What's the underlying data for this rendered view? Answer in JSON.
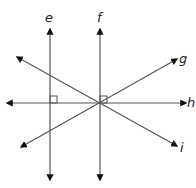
{
  "diagram": {
    "type": "geometry-lines",
    "stroke_color": "#555555",
    "arrow_color": "#111111",
    "lines": [
      {
        "id": "e",
        "label": "e",
        "kind": "vertical",
        "x1": 50,
        "y1": 29,
        "x2": 50,
        "y2": 180,
        "label_x": 45,
        "label_y": 11
      },
      {
        "id": "f",
        "label": "f",
        "kind": "vertical",
        "x1": 100,
        "y1": 29,
        "x2": 100,
        "y2": 180,
        "label_x": 97,
        "label_y": 11
      },
      {
        "id": "g",
        "label": "g",
        "kind": "diagonal",
        "x1": 21,
        "y1": 147,
        "x2": 177,
        "y2": 59,
        "label_x": 179,
        "label_y": 52
      },
      {
        "id": "h",
        "label": "h",
        "kind": "horizontal",
        "x1": 7,
        "y1": 103,
        "x2": 186,
        "y2": 103,
        "label_x": 187,
        "label_y": 96
      },
      {
        "id": "i",
        "label": "i",
        "kind": "diagonal",
        "x1": 17,
        "y1": 57,
        "x2": 177,
        "y2": 146,
        "label_x": 180,
        "label_y": 141
      }
    ],
    "right_angles": [
      {
        "at": "e-h",
        "x": 50,
        "y": 96,
        "size": 7
      },
      {
        "at": "f-h",
        "x": 100,
        "y": 96,
        "size": 7
      }
    ],
    "intersection": {
      "x": 100,
      "y": 103
    }
  }
}
